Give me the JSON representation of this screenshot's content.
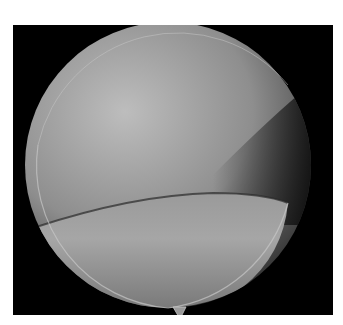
{
  "figure": {
    "colors": {
      "background": "#ffffff",
      "frame": "#000000",
      "tissue_light": "#b4b4b4",
      "tissue_dark": "#3a3a3a",
      "rim": "#c8c8c8"
    },
    "caption": ""
  }
}
